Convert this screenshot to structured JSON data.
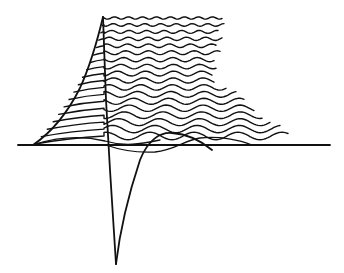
{
  "diagram": {
    "title": "",
    "type": "waveform-waterfall-sketch",
    "colors": {
      "ink": "#111111",
      "background": "#ffffff"
    },
    "baseline": {
      "x1": 18,
      "x2": 330,
      "y": 145
    },
    "spike": {
      "top": [
        103,
        17
      ],
      "tip": [
        116,
        264
      ]
    },
    "trace_count": 18,
    "labels": []
  }
}
